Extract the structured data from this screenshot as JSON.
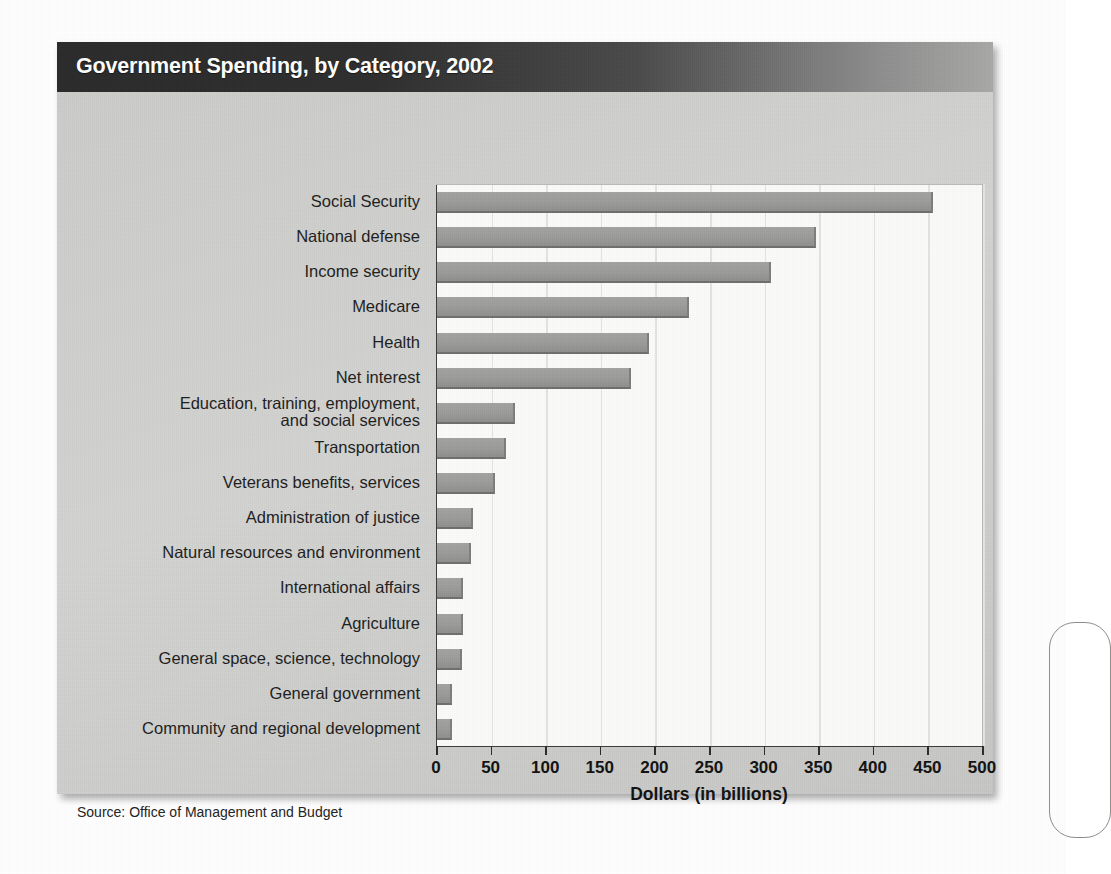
{
  "figure": {
    "title": "Government Spending, by Category, 2002",
    "source_note": "Source: Office of Management and Budget"
  },
  "colors": {
    "banner_dark": "#2a2a2a",
    "banner_light": "#a8a8a6",
    "chart_background": "#cbcbc9",
    "plot_background": "#fbfbfa",
    "bar_fill": "#9b9b99",
    "bar_edge": "#6e6e6c",
    "gridline": "#e4e4e2",
    "axis_line": "#3b3b3b",
    "text": "#1d1d1d"
  },
  "chart_data": {
    "type": "bar",
    "orientation": "horizontal",
    "title": "Government Spending, by Category, 2002",
    "xlabel": "Dollars (in billions)",
    "ylabel": "",
    "xlim": [
      0,
      500
    ],
    "xticks": [
      0,
      50,
      100,
      150,
      200,
      250,
      300,
      350,
      400,
      450,
      500
    ],
    "xtick_labels": [
      "0",
      "50",
      "100",
      "150",
      "200",
      "250",
      "300",
      "350",
      "400",
      "450",
      "500"
    ],
    "grid": "vertical",
    "legend": "none",
    "source": "Office of Management and Budget",
    "categories": [
      "Social Security",
      "National defense",
      "Income security",
      "Medicare",
      "Health",
      "Net interest",
      "Education, training, employment,\nand social services",
      "Transportation",
      "Veterans benefits, services",
      "Administration of justice",
      "Natural resources and environment",
      "International affairs",
      "Agriculture",
      "General space,  science, technology",
      "General government",
      "Community and regional development"
    ],
    "values": [
      452,
      345,
      304,
      229,
      192,
      176,
      70,
      61,
      51,
      31,
      29,
      22,
      22,
      21,
      12,
      12
    ]
  }
}
